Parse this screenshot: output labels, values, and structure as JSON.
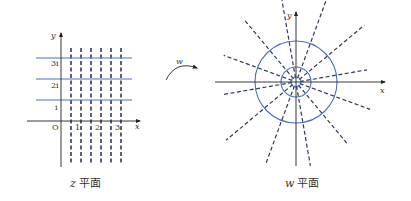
{
  "z_plane": {
    "caption_var": "z",
    "caption_text": "平面",
    "x_axis_label": "x",
    "y_axis_label": "y",
    "origin_label": "O",
    "x_ticks": [
      "1",
      "2",
      "3"
    ],
    "y_ticks": [
      "i",
      "2i",
      "3i"
    ],
    "horizontal_lines_im": [
      1,
      2,
      3
    ],
    "vertical_dashed_lines_re": [
      0.5,
      1,
      1.5,
      2,
      2.5,
      3
    ]
  },
  "mapping": {
    "label": "w"
  },
  "w_plane": {
    "caption_var": "w",
    "caption_text": "平面",
    "x_axis_label": "x",
    "y_axis_label": "y",
    "circles": [
      "small",
      "medium",
      "large"
    ],
    "radial_dashed_lines": 12
  },
  "colors": {
    "solid_lines": "#4a6fc4",
    "dashed_lines": "#2d3a5a",
    "axes": "#222222"
  }
}
